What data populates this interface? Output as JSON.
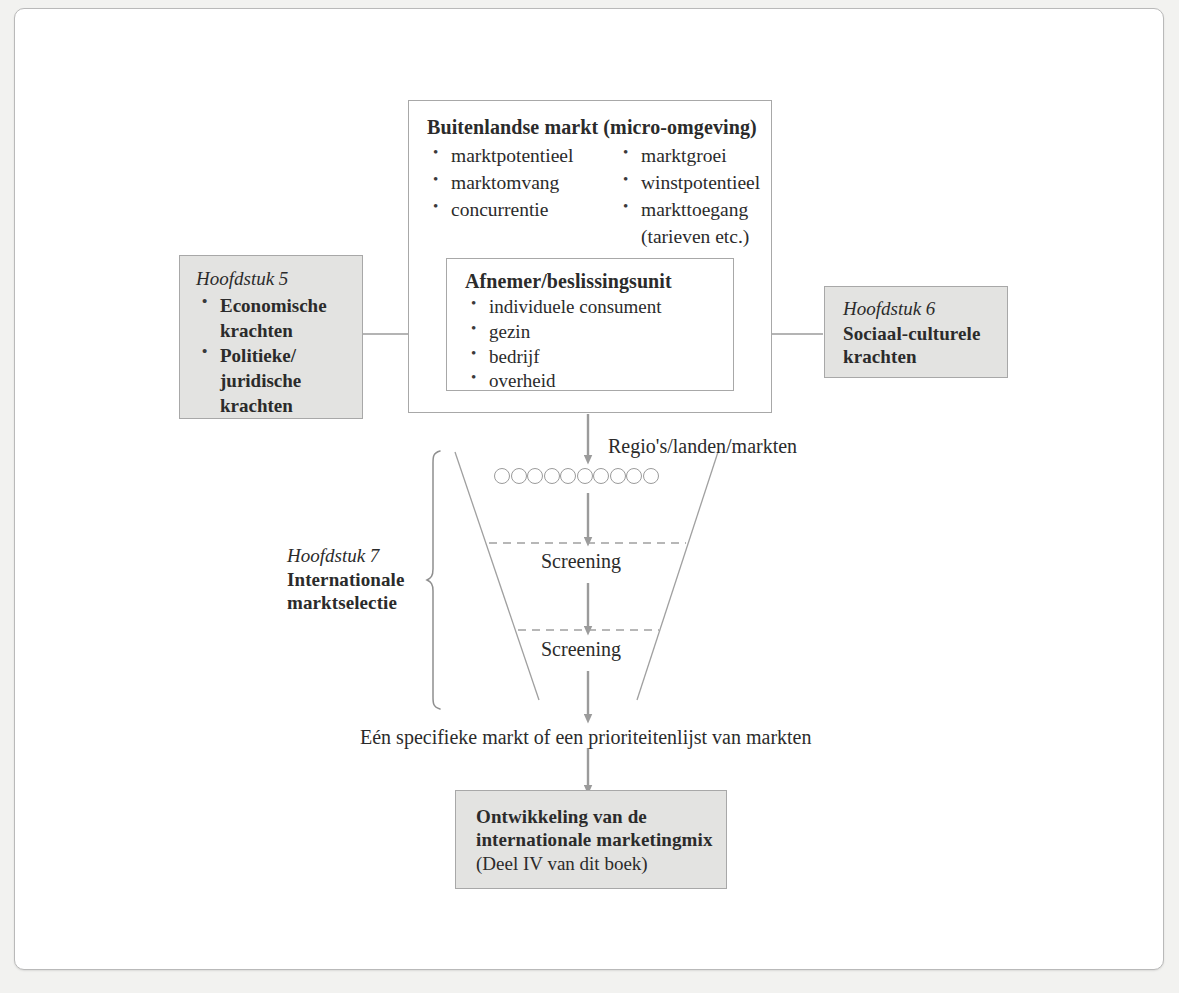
{
  "diagram": {
    "accent_gray": "#e3e3e1",
    "line_gray": "#9b9b9b"
  },
  "market_box": {
    "title": "Buitenlandse markt (micro-omgeving)",
    "column_left": [
      "marktpotentieel",
      "marktomvang",
      "concurrentie"
    ],
    "column_right": [
      "marktgroei",
      "winstpotentieel",
      "markttoegang"
    ],
    "column_right_continuation": "(tarieven etc.)"
  },
  "buyer_box": {
    "title": "Afnemer/beslissingsunit",
    "items": [
      "individuele consument",
      "gezin",
      "bedrijf",
      "overheid"
    ]
  },
  "chapter5": {
    "label": "Hoofdstuk 5",
    "items": [
      "Economische krachten",
      "Politieke/ juridische krachten"
    ]
  },
  "chapter6": {
    "label": "Hoofdstuk 6",
    "title": "Sociaal-culturele krachten"
  },
  "chapter7": {
    "label": "Hoofdstuk 7",
    "title": "Internationale marktselectie"
  },
  "funnel": {
    "input_label": "Regio's/landen/markten",
    "circle_count": 10,
    "screening_1": "Screening",
    "screening_2": "Screening",
    "output_label": "Eén specifieke markt of een prioriteitenlijst van markten"
  },
  "result_box": {
    "title_line1": "Ontwikkeling van de",
    "title_line2": "internationale marketingmix",
    "subtitle": "(Deel IV van dit boek)"
  }
}
